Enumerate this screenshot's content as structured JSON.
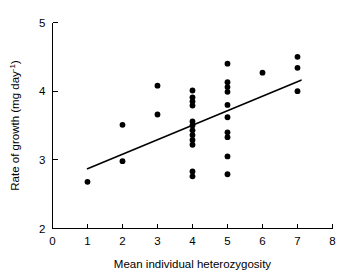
{
  "chart_data": {
    "type": "scatter",
    "title": "",
    "xlabel": "Mean individual heterozygosity",
    "ylabel": "Rate of growth (mg day",
    "ylabel_exponent": "-1",
    "ylabel_close": ")",
    "xlim": [
      0,
      8
    ],
    "ylim": [
      2,
      5
    ],
    "xticks": [
      0,
      1,
      2,
      3,
      4,
      5,
      6,
      7,
      8
    ],
    "yticks": [
      2,
      3,
      4,
      5
    ],
    "xtick_labels": [
      "0",
      "1",
      "2",
      "3",
      "4",
      "5",
      "6",
      "7",
      "8"
    ],
    "ytick_labels": [
      "2",
      "3",
      "4",
      "5"
    ],
    "grid": false,
    "legend": false,
    "marker": "filled-circle",
    "marker_color": "#000000",
    "points": [
      {
        "x": 1,
        "y": 2.68
      },
      {
        "x": 2,
        "y": 3.51
      },
      {
        "x": 2,
        "y": 2.98
      },
      {
        "x": 3,
        "y": 4.08
      },
      {
        "x": 3,
        "y": 3.66
      },
      {
        "x": 4,
        "y": 4.01
      },
      {
        "x": 4,
        "y": 3.91
      },
      {
        "x": 4,
        "y": 3.85
      },
      {
        "x": 4,
        "y": 3.79
      },
      {
        "x": 4,
        "y": 3.56
      },
      {
        "x": 4,
        "y": 3.5
      },
      {
        "x": 4,
        "y": 3.43
      },
      {
        "x": 4,
        "y": 3.36
      },
      {
        "x": 4,
        "y": 3.29
      },
      {
        "x": 4,
        "y": 3.22
      },
      {
        "x": 4,
        "y": 2.83
      },
      {
        "x": 4,
        "y": 2.76
      },
      {
        "x": 5,
        "y": 4.4
      },
      {
        "x": 5,
        "y": 4.13
      },
      {
        "x": 5,
        "y": 4.06
      },
      {
        "x": 5,
        "y": 3.99
      },
      {
        "x": 5,
        "y": 3.8
      },
      {
        "x": 5,
        "y": 3.62
      },
      {
        "x": 5,
        "y": 3.4
      },
      {
        "x": 5,
        "y": 3.33
      },
      {
        "x": 5,
        "y": 3.05
      },
      {
        "x": 5,
        "y": 2.79
      },
      {
        "x": 6,
        "y": 4.27
      },
      {
        "x": 7,
        "y": 4.5
      },
      {
        "x": 7,
        "y": 4.34
      },
      {
        "x": 7,
        "y": 4.0
      }
    ],
    "fit_line": {
      "x_start": 1.0,
      "y_start": 2.87,
      "x_end": 7.1,
      "y_end": 4.16
    }
  }
}
